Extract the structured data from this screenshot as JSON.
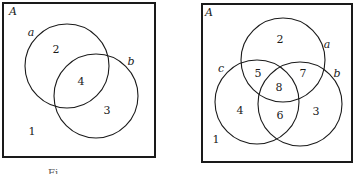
{
  "diagrams": [
    {
      "universe_label": "A",
      "sets": [
        {
          "label": "a",
          "cx": 67,
          "cy": 66,
          "r": 42,
          "label_x": 31,
          "label_y": 33
        },
        {
          "label": "b",
          "cx": 96,
          "cy": 96,
          "r": 42,
          "label_x": 131,
          "label_y": 62
        }
      ],
      "regions": [
        {
          "label": "1",
          "x": 32,
          "y": 132
        },
        {
          "label": "2",
          "x": 56,
          "y": 50
        },
        {
          "label": "4",
          "x": 81,
          "y": 82
        },
        {
          "label": "3",
          "x": 107,
          "y": 111
        }
      ]
    },
    {
      "universe_label": "A",
      "sets": [
        {
          "label": "a",
          "cx": 283,
          "cy": 60,
          "r": 42,
          "label_x": 327,
          "label_y": 45
        },
        {
          "label": "b",
          "cx": 300,
          "cy": 104,
          "r": 42,
          "label_x": 337,
          "label_y": 74
        },
        {
          "label": "c",
          "cx": 257,
          "cy": 102,
          "r": 42,
          "label_x": 221,
          "label_y": 69
        }
      ],
      "regions": [
        {
          "label": "1",
          "x": 216,
          "y": 140
        },
        {
          "label": "2",
          "x": 280,
          "y": 40
        },
        {
          "label": "5",
          "x": 258,
          "y": 74
        },
        {
          "label": "7",
          "x": 303,
          "y": 74
        },
        {
          "label": "8",
          "x": 279,
          "y": 88
        },
        {
          "label": "4",
          "x": 240,
          "y": 111
        },
        {
          "label": "6",
          "x": 280,
          "y": 116
        },
        {
          "label": "3",
          "x": 316,
          "y": 112
        }
      ]
    }
  ],
  "caption_fragment": "Fi"
}
